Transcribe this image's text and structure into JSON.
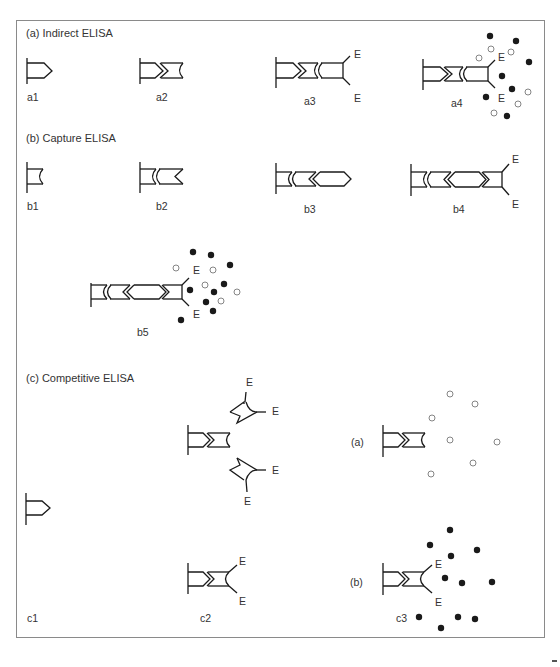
{
  "figure": {
    "sections": [
      {
        "id": "a",
        "title": "(a) Indirect ELISA",
        "steps": [
          {
            "label": "a1",
            "components": [
              "solid-phase",
              "antigen"
            ]
          },
          {
            "label": "a2",
            "components": [
              "solid-phase",
              "antigen",
              "primary-antibody"
            ]
          },
          {
            "label": "a3",
            "components": [
              "solid-phase",
              "antigen",
              "primary-antibody",
              "enzyme-labelled-secondary-antibody"
            ],
            "enzyme_labels": [
              "E",
              "E"
            ]
          },
          {
            "label": "a4",
            "components": [
              "solid-phase",
              "antigen",
              "primary-antibody",
              "enzyme-labelled-secondary-antibody",
              "substrate",
              "product"
            ],
            "enzyme_labels": [
              "E",
              "E"
            ],
            "solid_dots": 9,
            "open_dots": 7
          }
        ]
      },
      {
        "id": "b",
        "title": "(b) Capture ELISA",
        "steps": [
          {
            "label": "b1",
            "components": [
              "solid-phase",
              "capture-antibody"
            ]
          },
          {
            "label": "b2",
            "components": [
              "solid-phase",
              "capture-antibody",
              "antigen"
            ]
          },
          {
            "label": "b3",
            "components": [
              "solid-phase",
              "capture-antibody",
              "antigen",
              "detection-antibody"
            ]
          },
          {
            "label": "b4",
            "components": [
              "solid-phase",
              "capture-antibody",
              "antigen",
              "detection-antibody",
              "enzyme-labelled-antibody"
            ],
            "enzyme_labels": [
              "E",
              "E"
            ]
          },
          {
            "label": "b5",
            "components": [
              "solid-phase",
              "capture-antibody",
              "antigen",
              "detection-antibody",
              "enzyme-labelled-antibody",
              "substrate",
              "product"
            ],
            "enzyme_labels": [
              "E",
              "E"
            ],
            "solid_dots": 10,
            "open_dots": 6
          }
        ]
      },
      {
        "id": "c",
        "title": "(c) Competitive ELISA",
        "steps": [
          {
            "label": "c1",
            "components": [
              "solid-phase",
              "antigen"
            ]
          },
          {
            "label": "c2",
            "components": [
              "solid-phase",
              "antigen",
              "antibody",
              "free-enzyme-labelled-antibody"
            ],
            "enzyme_labels": [
              "E",
              "E",
              "E",
              "E",
              "E",
              "E"
            ]
          },
          {
            "label": "c3",
            "sub_panels": [
              {
                "label": "(a)",
                "description": "competitor bound, no enzyme",
                "open_dots": 7
              },
              {
                "label": "(b)",
                "description": "enzyme-labelled antibody bound",
                "enzyme_labels": [
                  "E",
                  "E"
                ],
                "solid_dots": 11
              }
            ]
          }
        ]
      }
    ],
    "legend_symbols": {
      "enzyme": "E",
      "solid_dot": "coloured product",
      "open_dot": "substrate"
    },
    "colors": {
      "ink": "#1a1a1a",
      "frame": "#888888",
      "open_dot_stroke": "#777777",
      "background": "#ffffff"
    }
  }
}
